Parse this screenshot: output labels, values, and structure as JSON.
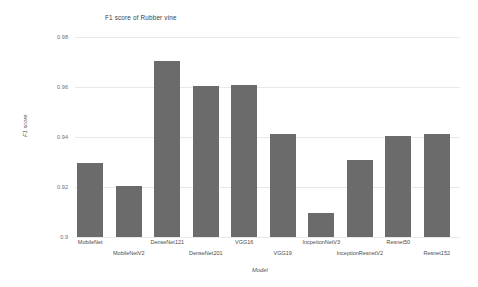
{
  "chart_data": {
    "type": "bar",
    "title": "F1 score of Rubber vine",
    "xlabel": "Model",
    "ylabel": "F1 score",
    "ylim": [
      0.9,
      0.98
    ],
    "yticks": [
      0.98,
      0.96,
      0.94,
      0.92,
      0.9
    ],
    "ytick_labels": [
      "0.98",
      "0.96",
      "0.94",
      "0.92",
      "0.9"
    ],
    "grid": true,
    "legend": "none",
    "bar_color": "#6b6b6b",
    "categories": [
      "MobileNet",
      "MobileNetV2",
      "DenseNet121",
      "DenseNet201",
      "VGG16",
      "VGG19",
      "IncpetionNetV3",
      "InceptionResnetV2",
      "Resnet50",
      "Resnet152"
    ],
    "values": [
      0.9296,
      0.9206,
      0.9705,
      0.9605,
      0.9608,
      0.9411,
      0.9098,
      0.9308,
      0.9406,
      0.9412
    ]
  }
}
